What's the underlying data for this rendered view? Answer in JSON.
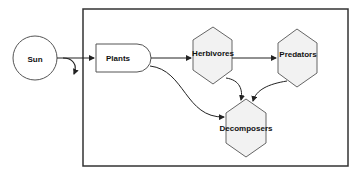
{
  "diagram": {
    "type": "food-web flow diagram",
    "nodes": [
      {
        "id": "sun",
        "label": "Sun",
        "shape": "circle"
      },
      {
        "id": "plants",
        "label": "Plants",
        "shape": "rounded-right rectangle"
      },
      {
        "id": "herbivores",
        "label": "Herbivores",
        "shape": "hexagon"
      },
      {
        "id": "predators",
        "label": "Predators",
        "shape": "hexagon"
      },
      {
        "id": "decomposers",
        "label": "Decomposers",
        "shape": "hexagon"
      }
    ],
    "edges": [
      {
        "from": "sun",
        "to": "plants"
      },
      {
        "from": "sun",
        "to": "outside",
        "note": "curved arrow downward (energy lost)"
      },
      {
        "from": "plants",
        "to": "herbivores"
      },
      {
        "from": "plants",
        "to": "decomposers"
      },
      {
        "from": "herbivores",
        "to": "predators"
      },
      {
        "from": "herbivores",
        "to": "decomposers"
      },
      {
        "from": "predators",
        "to": "decomposers"
      }
    ],
    "colors": {
      "stroke": "#333333",
      "hex_fill": "#f2f2f2",
      "background": "#ffffff"
    }
  }
}
